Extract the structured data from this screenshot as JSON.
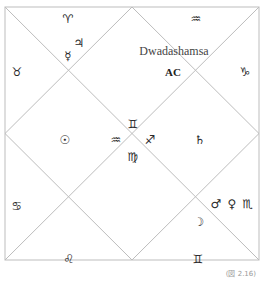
{
  "chart_title": "Dwadashamsa",
  "ascendant_label": "AC",
  "caption": "(図 2.16)",
  "colors": {
    "lines": "#bdbdbd",
    "text": "#2a2a2a"
  },
  "houses": {
    "h1_top_center": {
      "sign": "♒",
      "planets": "",
      "ac": "AC"
    },
    "h2_top_left": {
      "sign": "♈",
      "planets": "♃ ☿"
    },
    "h3_left_top": {
      "sign": "♉",
      "planets": ""
    },
    "h4_center_left": {
      "sign": "♒",
      "planets": "☉"
    },
    "h5_left_bottom": {
      "sign": "♋",
      "planets": ""
    },
    "h6_bottom_left": {
      "sign": "♌",
      "planets": ""
    },
    "h7_bottom_center": {
      "sign": "♍",
      "planets": ""
    },
    "h8_bottom_right": {
      "sign": "♊",
      "planets": "☽"
    },
    "h9_right_bottom": {
      "sign": "♏",
      "planets": "♂ ♀"
    },
    "h10_center_right": {
      "sign": "♐",
      "planets": "♄"
    },
    "h11_right_top": {
      "sign": "♑",
      "planets": ""
    },
    "h12_top_center_inner": {
      "sign": "♊",
      "planets": ""
    }
  },
  "glyphs": {
    "aries": "♈",
    "jupiter": "♃",
    "mercury": "☿",
    "taurus": "♉",
    "aquarius_top": "♒",
    "capricorn": "♑",
    "sun": "☉",
    "aquarius_mid": "♒",
    "gemini_mid": "♊",
    "sagittarius": "♐",
    "virgo": "♍",
    "saturn": "♄",
    "cancer": "♋",
    "leo": "♌",
    "gemini_bottom": "♊",
    "moon": "☽",
    "mars": "♂",
    "venus": "♀",
    "scorpio": "♏"
  }
}
